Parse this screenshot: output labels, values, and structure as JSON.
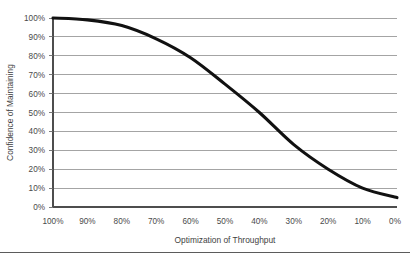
{
  "chart_data": {
    "type": "line",
    "title": "",
    "xlabel": "Optimization of Throughput",
    "ylabel": "Confidence of Maintaining",
    "x": [
      100,
      90,
      80,
      70,
      60,
      50,
      40,
      30,
      20,
      10,
      0
    ],
    "values": [
      100,
      99,
      96,
      89,
      79,
      65,
      50,
      33,
      20,
      10,
      5
    ],
    "series": [
      {
        "name": "Confidence of Maintaining",
        "values": [
          100,
          99,
          96,
          89,
          79,
          65,
          50,
          33,
          20,
          10,
          5
        ],
        "color": "#111111"
      }
    ],
    "categories": [
      "100%",
      "90%",
      "80%",
      "70%",
      "60%",
      "50%",
      "40%",
      "30%",
      "20%",
      "10%",
      "0%"
    ],
    "x_tick_labels": [
      "100%",
      "90%",
      "80%",
      "70%",
      "60%",
      "50%",
      "40%",
      "30%",
      "20%",
      "10%",
      "0%"
    ],
    "y_tick_labels": [
      "100%",
      "90%",
      "80%",
      "70%",
      "60%",
      "50%",
      "40%",
      "30%",
      "20%",
      "10%",
      "0%"
    ],
    "y_tick_values": [
      100,
      90,
      80,
      70,
      60,
      50,
      40,
      30,
      20,
      10,
      0
    ],
    "xlim": [
      100,
      0
    ],
    "ylim": [
      0,
      100
    ],
    "x_axis_reversed": true,
    "grid": true,
    "grid_axis": "y",
    "legend": false,
    "legend_position": "none",
    "annotations": []
  },
  "style": {
    "grid_color": "#9a9a9a",
    "axis_color": "#4d4d4d",
    "curve_color": "#111111",
    "text_color": "#4a4a4a",
    "background": "#ffffff",
    "footer_rule_color": "#5b5b5b"
  }
}
